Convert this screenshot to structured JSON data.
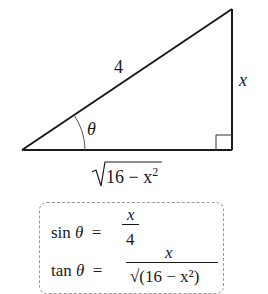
{
  "diagram": {
    "type": "right-triangle",
    "labels": {
      "hypotenuse": "4",
      "opposite": "x",
      "angle": "θ",
      "adjacent_radicand": "16 − x",
      "adjacent_exponent": "2",
      "radical": "√"
    },
    "formulas": {
      "sin": {
        "lhs_fn": "sin",
        "lhs_var": "θ",
        "equals": "=",
        "numerator": "x",
        "denominator": "4"
      },
      "tan": {
        "lhs_fn": "tan",
        "lhs_var": "θ",
        "equals": "=",
        "numerator": "x",
        "denominator": "√(16 − x²)"
      }
    },
    "colors": {
      "stroke": "#1a1a1a",
      "arc": "#555555",
      "box_border": "#9a9a9a"
    }
  }
}
